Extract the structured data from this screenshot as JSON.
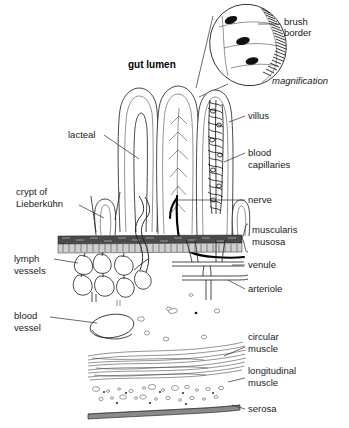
{
  "figure": {
    "background_color": "#ffffff",
    "ink_color": "#1a1a1a",
    "width": 349,
    "height": 428
  },
  "headings": {
    "gut_lumen": "gut lumen",
    "magnification": "magnification"
  },
  "labels": {
    "brush_border": "brush\nborder",
    "brush_border_line1": "brush",
    "brush_border_line2": "border",
    "villus": "villus",
    "blood_capillaries_line1": "blood",
    "blood_capillaries_line2": "capillaries",
    "nerve": "nerve",
    "muscularis_line1": "muscularis",
    "muscularis_line2": "musosa",
    "venule": "venule",
    "arteriole": "arteriole",
    "circular_muscle_line1": "circular",
    "circular_muscle_line2": "muscle",
    "longitudinal_muscle_line1": "longitudinal",
    "longitudinal_muscle_line2": "muscle",
    "serosa": "serosa",
    "lacteal": "lacteal",
    "crypt_line1": "crypt of",
    "crypt_line2": "Lieberkühn",
    "lymph_vessels_line1": "lymph",
    "lymph_vessels_line2": "vessels",
    "blood_vessel_line1": "blood",
    "blood_vessel_line2": "vessel"
  },
  "structures": [
    {
      "name": "magnification-inset",
      "description": "oval inset showing three columnar epithelial cells with dark oval nuclei and a hatched brush border of microvilli along the right edge"
    },
    {
      "name": "villus-1",
      "description": "leftmost finger-like villus containing a lacteal (central lymph vessel)"
    },
    {
      "name": "villus-2",
      "description": "middle villus containing a branching vascular/nerve tree"
    },
    {
      "name": "villus-3",
      "description": "right villus densely packed with blood capillaries"
    },
    {
      "name": "crypt-of-lieberkuhn",
      "description": "U-shaped epithelial invagination between villi"
    },
    {
      "name": "muscularis-mucosa",
      "description": "two horizontal bands: a dark stippled upper band and a lighter cellular lower band"
    },
    {
      "name": "lymph-vessel-network",
      "description": "network of irregular polygonal lymphatic chambers beneath the muscularis mucosa"
    },
    {
      "name": "nerve-trunk",
      "description": "thick black line descending from villus base through muscularis mucosa"
    },
    {
      "name": "venule",
      "description": "vessel branching below the muscularis mucosa"
    },
    {
      "name": "arteriole",
      "description": "vessel branching below the venule"
    },
    {
      "name": "blood-vessel-oval",
      "description": "large oval vessel cross-section in the submucosa"
    },
    {
      "name": "circular-muscle",
      "description": "band of long wavy muscle fibres seen lengthwise"
    },
    {
      "name": "longitudinal-muscle",
      "description": "band of scattered oval muscle cell cross-sections"
    },
    {
      "name": "serosa",
      "description": "thin dark outermost band"
    }
  ]
}
